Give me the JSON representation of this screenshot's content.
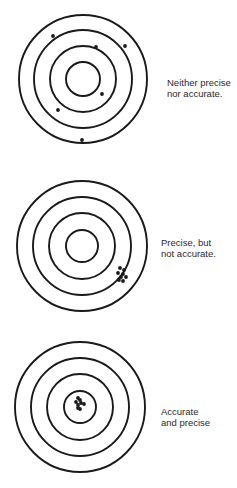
{
  "diagram": {
    "type": "accuracy-precision-targets",
    "colors": {
      "ink": "#1a1a1a",
      "text": "#2a2a2a",
      "background": "#ffffff"
    },
    "targets": [
      {
        "id": "neither",
        "caption_lines": [
          "Neither precise",
          "nor accurate."
        ],
        "center": [
          83,
          79
        ],
        "ring_radii": [
          64,
          49,
          33,
          17
        ],
        "shots": [
          [
            53,
            36
          ],
          [
            96,
            47
          ],
          [
            125,
            46
          ],
          [
            102,
            94
          ],
          [
            58,
            110
          ],
          [
            82,
            140
          ]
        ]
      },
      {
        "id": "precise-not-accurate",
        "caption_lines": [
          "Precise, but",
          "not accurate."
        ],
        "center": [
          82,
          246
        ],
        "ring_radii": [
          65,
          49,
          33,
          16
        ],
        "shots": [
          [
            120,
            268
          ],
          [
            124,
            270
          ],
          [
            118,
            273
          ],
          [
            123,
            274
          ],
          [
            121,
            277
          ],
          [
            126,
            277
          ],
          [
            119,
            280
          ],
          [
            123,
            281
          ]
        ]
      },
      {
        "id": "accurate-and-precise",
        "caption_lines": [
          "Accurate",
          "and precise"
        ],
        "center": [
          80,
          407
        ],
        "ring_radii": [
          65,
          49,
          33,
          16
        ],
        "shots": [
          [
            78,
            398
          ],
          [
            80,
            400
          ],
          [
            76,
            402
          ],
          [
            81,
            403
          ],
          [
            78,
            405
          ],
          [
            84,
            404
          ],
          [
            78,
            408
          ],
          [
            80,
            409
          ]
        ]
      }
    ]
  }
}
